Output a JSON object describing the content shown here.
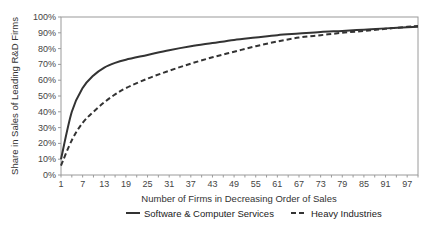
{
  "chart_data": {
    "type": "line",
    "title": "",
    "xlabel": "Number of Firms in Decreasing Order of Sales",
    "ylabel": "Share in Sales of Leading R&D Firms",
    "xlim": [
      1,
      100
    ],
    "ylim": [
      0,
      100
    ],
    "grid": false,
    "legend_position": "bottom",
    "x_ticks": [
      "1",
      "7",
      "13",
      "19",
      "25",
      "31",
      "37",
      "43",
      "49",
      "55",
      "61",
      "67",
      "73",
      "79",
      "85",
      "91",
      "97"
    ],
    "y_ticks": [
      "0%",
      "10%",
      "20%",
      "30%",
      "40%",
      "50%",
      "60%",
      "70%",
      "80%",
      "90%",
      "100%"
    ],
    "x": [
      1,
      4,
      7,
      10,
      13,
      16,
      19,
      25,
      31,
      37,
      43,
      49,
      55,
      61,
      67,
      73,
      79,
      85,
      91,
      97,
      100
    ],
    "series": [
      {
        "name": "Software & Computer Services",
        "style": "solid",
        "color": "#333333",
        "values": [
          10,
          40,
          55,
          63,
          68,
          71,
          73,
          76,
          79,
          81.5,
          83.5,
          85.5,
          87,
          88.5,
          89.5,
          90.5,
          91.2,
          92,
          92.8,
          93.5,
          93.8
        ]
      },
      {
        "name": "Heavy Industries",
        "style": "dashed",
        "color": "#333333",
        "values": [
          6,
          22,
          33,
          40,
          46,
          51,
          55,
          61,
          66,
          70.5,
          74.5,
          78,
          81.5,
          84.5,
          87,
          88.5,
          90,
          91.2,
          92.5,
          93.8,
          94.3
        ]
      }
    ]
  }
}
